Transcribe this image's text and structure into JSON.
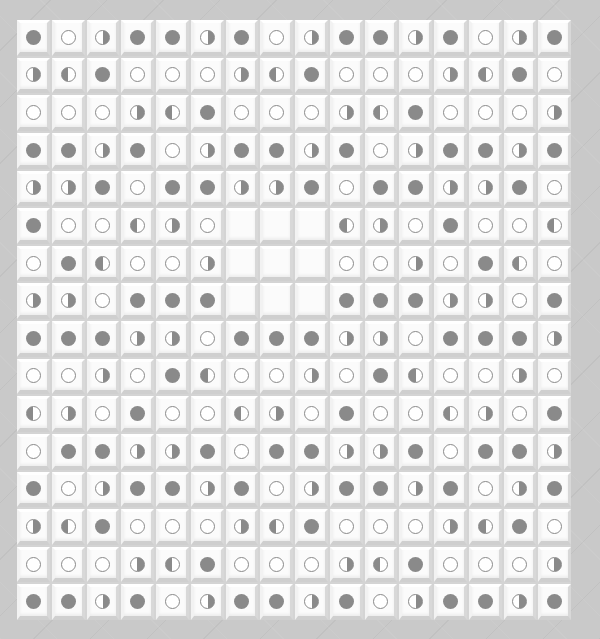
{
  "board": {
    "columns": 16,
    "rows": 16,
    "legend": {
      "F": "filled-circle",
      "O": "empty-circle",
      "R": "right-half-filled-circle",
      "L": "left-half-filled-circle",
      "E": "blank-tile"
    },
    "colors": {
      "background": "#c9c9c9",
      "tile_face": "#fbfbfb",
      "disc_fill": "#8a8a8a",
      "disc_outline": "#8a8a8a"
    },
    "cells": [
      [
        "F",
        "O",
        "R",
        "F",
        "F",
        "R",
        "F",
        "O",
        "R",
        "F",
        "F",
        "R",
        "F",
        "O",
        "R",
        "F"
      ],
      [
        "R",
        "L",
        "F",
        "O",
        "O",
        "O",
        "R",
        "L",
        "F",
        "O",
        "O",
        "O",
        "R",
        "L",
        "F",
        "O"
      ],
      [
        "O",
        "O",
        "O",
        "R",
        "L",
        "F",
        "O",
        "O",
        "O",
        "R",
        "L",
        "F",
        "O",
        "O",
        "O",
        "R"
      ],
      [
        "F",
        "F",
        "R",
        "F",
        "O",
        "R",
        "F",
        "F",
        "R",
        "F",
        "O",
        "R",
        "F",
        "F",
        "R",
        "F"
      ],
      [
        "R",
        "R",
        "F",
        "O",
        "F",
        "F",
        "R",
        "R",
        "F",
        "O",
        "F",
        "F",
        "R",
        "R",
        "F",
        "O"
      ],
      [
        "F",
        "O",
        "O",
        "L",
        "R",
        "O",
        "E",
        "E",
        "E",
        "L",
        "R",
        "O",
        "F",
        "O",
        "O",
        "L"
      ],
      [
        "O",
        "F",
        "L",
        "O",
        "O",
        "R",
        "E",
        "E",
        "E",
        "O",
        "O",
        "R",
        "O",
        "F",
        "L",
        "O"
      ],
      [
        "R",
        "R",
        "O",
        "F",
        "F",
        "F",
        "E",
        "E",
        "E",
        "F",
        "F",
        "F",
        "R",
        "R",
        "O",
        "F"
      ],
      [
        "F",
        "F",
        "F",
        "R",
        "R",
        "O",
        "F",
        "F",
        "F",
        "R",
        "R",
        "O",
        "F",
        "F",
        "F",
        "R"
      ],
      [
        "O",
        "O",
        "R",
        "O",
        "F",
        "L",
        "O",
        "O",
        "R",
        "O",
        "F",
        "L",
        "O",
        "O",
        "R",
        "O"
      ],
      [
        "L",
        "R",
        "O",
        "F",
        "O",
        "O",
        "L",
        "R",
        "O",
        "F",
        "O",
        "O",
        "L",
        "R",
        "O",
        "F"
      ],
      [
        "O",
        "F",
        "F",
        "R",
        "R",
        "F",
        "O",
        "F",
        "F",
        "R",
        "R",
        "F",
        "O",
        "F",
        "F",
        "R"
      ],
      [
        "F",
        "O",
        "R",
        "F",
        "F",
        "R",
        "F",
        "O",
        "R",
        "F",
        "F",
        "R",
        "F",
        "O",
        "R",
        "F"
      ],
      [
        "R",
        "L",
        "F",
        "O",
        "O",
        "O",
        "R",
        "L",
        "F",
        "O",
        "O",
        "O",
        "R",
        "L",
        "F",
        "O"
      ],
      [
        "O",
        "O",
        "O",
        "R",
        "L",
        "F",
        "O",
        "O",
        "O",
        "R",
        "L",
        "F",
        "O",
        "O",
        "O",
        "R"
      ],
      [
        "F",
        "F",
        "R",
        "F",
        "O",
        "R",
        "F",
        "F",
        "R",
        "F",
        "O",
        "R",
        "F",
        "F",
        "R",
        "F"
      ]
    ]
  }
}
